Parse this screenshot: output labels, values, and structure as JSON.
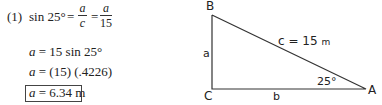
{
  "solution": {
    "step_number": "(1)",
    "line1": {
      "lhs": "sin 25°",
      "equals1": "=",
      "frac1": {
        "num": "a",
        "den": "c"
      },
      "equals2": "=",
      "frac2": {
        "num": "a",
        "den": "15"
      }
    },
    "line2": {
      "var": "a",
      "rest": " = 15 sin 25°"
    },
    "line3": {
      "var": "a",
      "rest": " = (15) (.4226)"
    },
    "answer": {
      "var": "a",
      "rest": " = 6.34 m"
    }
  },
  "triangle": {
    "vertices": {
      "A": "A",
      "B": "B",
      "C": "C"
    },
    "sides": {
      "a": "a",
      "b": "b",
      "c_label": "c = 15",
      "c_unit": "m"
    },
    "angle_A": "25°",
    "colors": {
      "line": "#333333",
      "text": "#222222"
    }
  }
}
